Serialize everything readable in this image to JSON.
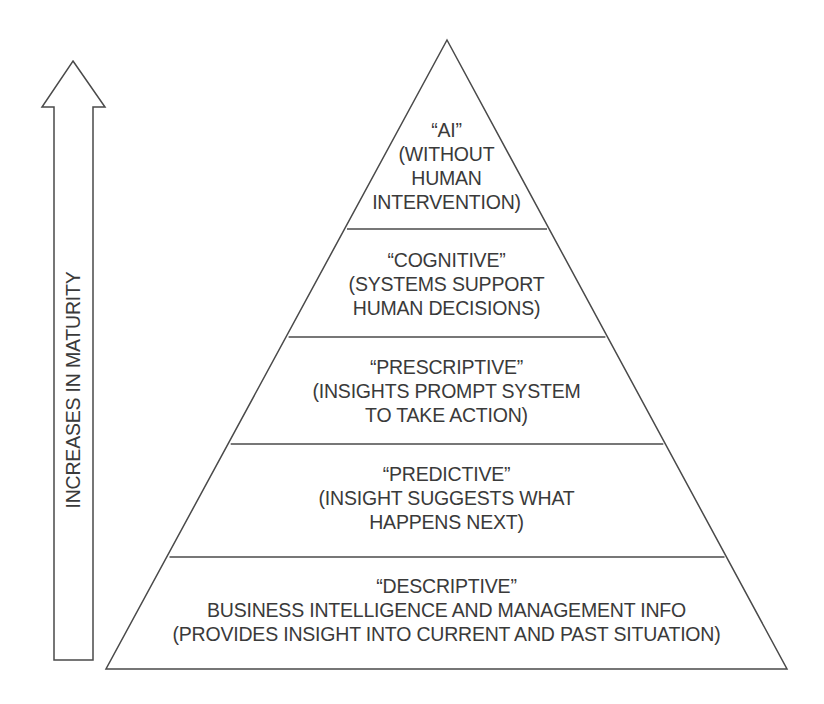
{
  "arrow": {
    "label": "INCREASES IN MATURITY",
    "direction": "up"
  },
  "pyramid": {
    "tiers": [
      {
        "title": "“AI”",
        "lines": [
          "(WITHOUT",
          "HUMAN",
          "INTERVENTION)"
        ]
      },
      {
        "title": "“COGNITIVE”",
        "lines": [
          "(SYSTEMS SUPPORT",
          "HUMAN DECISIONS)"
        ]
      },
      {
        "title": "“PRESCRIPTIVE”",
        "lines": [
          "(INSIGHTS PROMPT SYSTEM",
          "TO TAKE ACTION)"
        ]
      },
      {
        "title": "“PREDICTIVE”",
        "lines": [
          "(INSIGHT SUGGESTS WHAT",
          "HAPPENS NEXT)"
        ]
      },
      {
        "title": "“DESCRIPTIVE”",
        "lines": [
          "BUSINESS INTELLIGENCE AND MANAGEMENT INFO",
          "(PROVIDES INSIGHT INTO CURRENT AND PAST SITUATION)"
        ]
      }
    ]
  },
  "colors": {
    "stroke": "#4a4a4a",
    "text": "#3a3a3a",
    "background": "#ffffff"
  }
}
